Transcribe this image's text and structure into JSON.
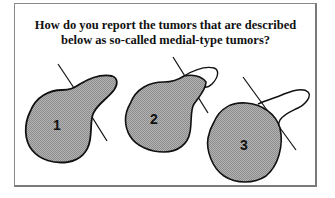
{
  "question": {
    "line1": "How do you report the tumors that are described",
    "line2": "below as so-called medial-type tumors?"
  },
  "diagrams": [
    {
      "label": "1",
      "description": "tumor mass with lobe extending beyond line, fully shaded"
    },
    {
      "label": "2",
      "description": "tumor mass with lobe partially extending beyond line, partially shaded"
    },
    {
      "label": "3",
      "description": "round tumor mass with unshaded outlined lobe beyond line"
    }
  ],
  "colors": {
    "fill": "#a8a8a8",
    "outline": "#111111",
    "frame": "#8a8a8a"
  }
}
